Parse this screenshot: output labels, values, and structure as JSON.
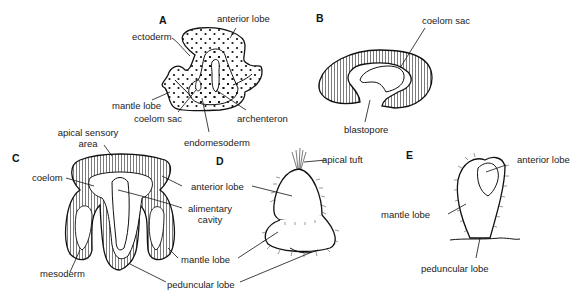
{
  "panels": {
    "A": {
      "letter": "A",
      "labels": {
        "anterior_lobe": "anterior lobe",
        "ectoderm": "ectoderm",
        "mantle_lobe": "mantle lobe",
        "coelom_sac": "coelom sac",
        "archenteron": "archenteron",
        "endomesoderm": "endomesoderm"
      }
    },
    "B": {
      "letter": "B",
      "labels": {
        "coelom_sac": "coelom sac",
        "blastopore": "blastopore"
      }
    },
    "C": {
      "letter": "C",
      "labels": {
        "apical_sensory_area_1": "apical sensory",
        "apical_sensory_area_2": "area",
        "coelom": "coelom",
        "anterior_lobe": "anterior lobe",
        "alimentary_cavity_1": "alimentary",
        "alimentary_cavity_2": "cavity",
        "mantle_lobe": "mantle lobe",
        "mesoderm": "mesoderm",
        "peduncular_lobe": "peduncular lobe"
      }
    },
    "D": {
      "letter": "D",
      "labels": {
        "apical_tuft": "apical tuft"
      }
    },
    "E": {
      "letter": "E",
      "labels": {
        "anterior_lobe": "anterior lobe",
        "mantle_lobe": "mantle lobe",
        "peduncular_lobe": "peduncular lobe"
      }
    }
  }
}
